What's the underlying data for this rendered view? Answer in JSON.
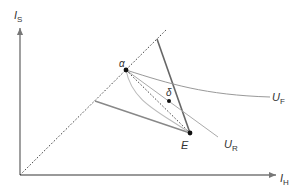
{
  "diagram": {
    "type": "economics-indifference-diagram",
    "axes": {
      "y_label": "I",
      "y_label_sub": "S",
      "x_label": "I",
      "x_label_sub": "H"
    },
    "points": {
      "alpha": {
        "label": "α"
      },
      "delta": {
        "label": "δ"
      },
      "E": {
        "label": "E"
      }
    },
    "curves": {
      "UF": {
        "label": "U",
        "sub": "F"
      },
      "UR": {
        "label": "U",
        "sub": "R"
      }
    },
    "colors": {
      "axis": "#777777",
      "dark_line": "#666666",
      "mid_line": "#888888",
      "light_curve": "#aaaaaa",
      "dotted": "#444444",
      "point": "#111111",
      "text": "#333333"
    }
  }
}
